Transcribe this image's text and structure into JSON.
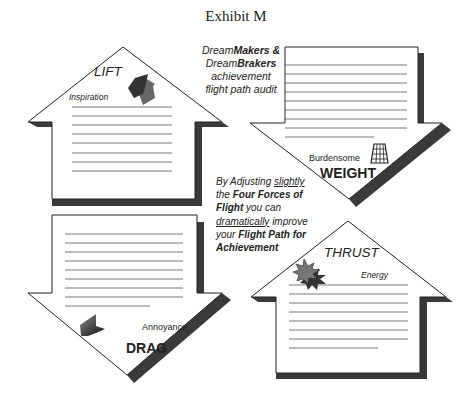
{
  "title": "Exhibit M",
  "audit_caption": {
    "line1_prefix": "Dream",
    "line1_bold": "Makers &",
    "line2_prefix": "Dream",
    "line2_bold": "Brakers",
    "line3": "achievement",
    "line4": "flight path audit"
  },
  "adjust_caption": {
    "p1": "By Adjusting ",
    "p1_u": "slightly",
    "p2": "the ",
    "p2_b": "Four Forces of",
    "p3_b": "Flight",
    "p3": " you can",
    "p4_u": "dramatically",
    "p4": " improve",
    "p5": "your ",
    "p5_b": "Flight Path for",
    "p6_b": "Achievement"
  },
  "forces": {
    "lift": {
      "label": "LIFT",
      "sublabel": "Inspiration",
      "icon": "up-arrows-icon",
      "direction": "up",
      "lines": 8
    },
    "weight": {
      "label": "WEIGHT",
      "sublabel": "Burdensome",
      "icon": "weight-grid-icon",
      "direction": "down",
      "lines": 9
    },
    "drag": {
      "label": "DRAG",
      "sublabel": "Annoyance",
      "icon": "chevron-left-icon",
      "direction": "down",
      "lines": 9
    },
    "thrust": {
      "label": "THRUST",
      "sublabel": "Energy",
      "icon": "starburst-icon",
      "direction": "up",
      "lines": 8
    }
  },
  "colors": {
    "outline": "#222222",
    "shadow": "#3a3a3a",
    "lines": "#555555",
    "icon_dark": "#333333",
    "icon_mid": "#666666"
  }
}
